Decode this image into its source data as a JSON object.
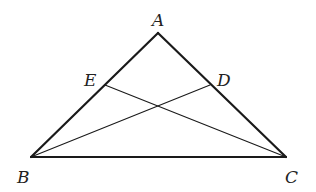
{
  "diagram": {
    "type": "geometry-triangle",
    "stroke_color": "#1a1a1a",
    "points": {
      "A": {
        "x": 158,
        "y": 33
      },
      "B": {
        "x": 31,
        "y": 157
      },
      "C": {
        "x": 286,
        "y": 157
      },
      "D": {
        "x": 210,
        "y": 85
      },
      "E": {
        "x": 105,
        "y": 85
      }
    },
    "labels": {
      "A": {
        "text": "A",
        "x": 152,
        "y": 26
      },
      "B": {
        "text": "B",
        "x": 17,
        "y": 183
      },
      "C": {
        "text": "C",
        "x": 285,
        "y": 183
      },
      "D": {
        "text": "D",
        "x": 217,
        "y": 86
      },
      "E": {
        "text": "E",
        "x": 84,
        "y": 86
      }
    },
    "segments": [
      {
        "name": "AB",
        "from": "A",
        "to": "B",
        "weight": "thick"
      },
      {
        "name": "AC",
        "from": "A",
        "to": "C",
        "weight": "thick"
      },
      {
        "name": "BC",
        "from": "B",
        "to": "C",
        "weight": "thick"
      },
      {
        "name": "BD",
        "from": "B",
        "to": "D",
        "weight": "thin"
      },
      {
        "name": "CE",
        "from": "C",
        "to": "E",
        "weight": "thin"
      }
    ]
  }
}
